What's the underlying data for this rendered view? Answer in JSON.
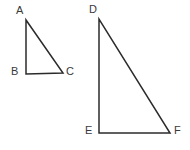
{
  "figure": {
    "background_color": "#ffffff",
    "stroke_color": "#2b2b2b",
    "label_color": "#3a3a3a",
    "shapes": [
      {
        "name": "triangle-abc",
        "kind": "triangle",
        "points": "26,20 26,74 63,73",
        "vertices": [
          {
            "label": "A",
            "x": 26,
            "y": 20
          },
          {
            "label": "B",
            "x": 26,
            "y": 74
          },
          {
            "label": "C",
            "x": 63,
            "y": 73
          }
        ]
      },
      {
        "name": "triangle-def",
        "kind": "triangle",
        "points": "99,19 99,133 170,133",
        "vertices": [
          {
            "label": "D",
            "x": 99,
            "y": 19
          },
          {
            "label": "E",
            "x": 99,
            "y": 133
          },
          {
            "label": "F",
            "x": 170,
            "y": 133
          }
        ]
      }
    ]
  },
  "labels": {
    "a": "A",
    "b": "B",
    "c": "C",
    "d": "D",
    "e": "E",
    "f": "F"
  }
}
